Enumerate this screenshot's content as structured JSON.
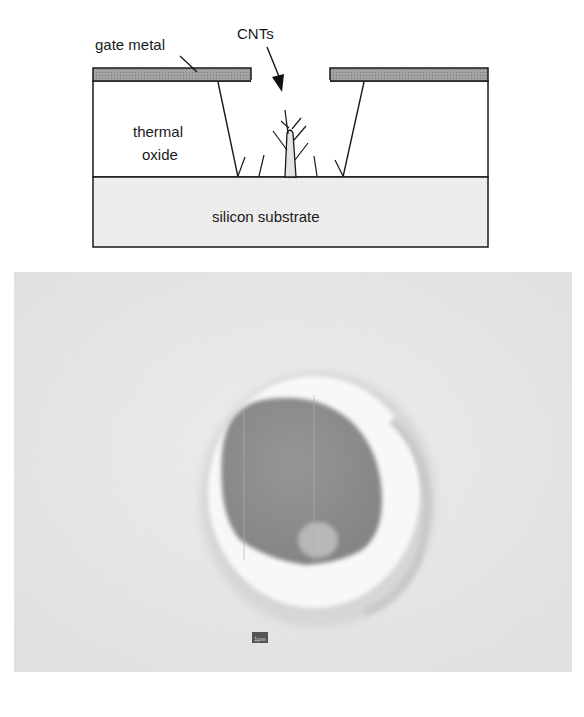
{
  "schematic": {
    "labels": {
      "gate_metal": "gate metal",
      "cnts": "CNTs",
      "thermal": "thermal",
      "oxide": "oxide",
      "substrate": "silicon substrate"
    },
    "colors": {
      "gate_metal": "#9a9a9a",
      "substrate": "#ececec",
      "oxide": "#ffffff",
      "line": "#1a1a1a"
    }
  },
  "sem_image": {
    "scale_bar": "1μm",
    "colors": {
      "background": "#e9e9e9",
      "hole": "#8e8e8e",
      "rim": "#f7f7f7"
    }
  }
}
